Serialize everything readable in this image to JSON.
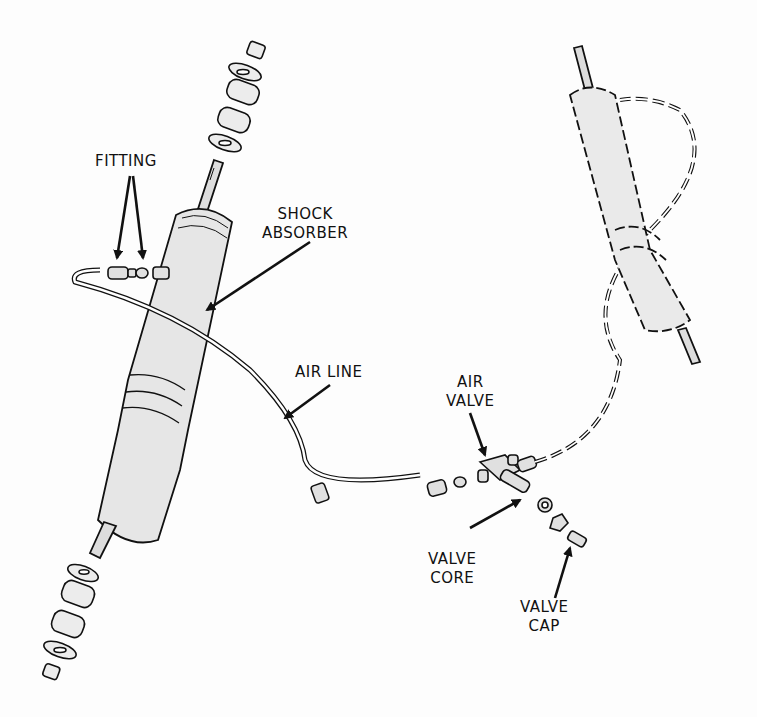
{
  "diagram": {
    "colors": {
      "ink": "#111111",
      "fill": "#e8e8e8",
      "background": "#fdfdfd"
    },
    "labels": {
      "fitting": "FITTING",
      "shock_absorber": "SHOCK\nABSORBER",
      "air_line": "AIR LINE",
      "air_valve": "AIR\nVALVE",
      "valve_core": "VALVE\nCORE",
      "valve_cap": "VALVE\nCAP"
    }
  }
}
